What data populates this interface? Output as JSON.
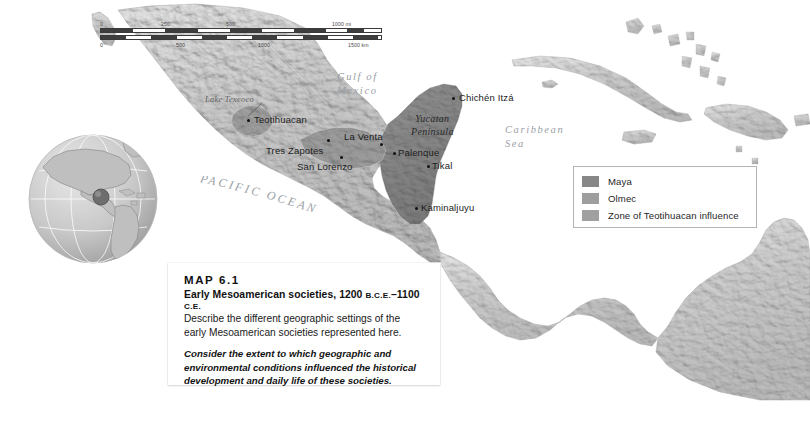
{
  "map": {
    "number": "MAP 6.1",
    "title_main": "Early Mesoamerican societies, 1200 ",
    "title_bce": "B.C.E.",
    "title_dash": "–1100 ",
    "title_ce": "C.E.",
    "prompt": "Describe the different geographic settings of the early Mesoamerican societies represented here.",
    "question": "Consider the extent to which geographic and environmental conditions influenced the historical development and daily life of these societies."
  },
  "scale": {
    "miles": {
      "unit": "1000 mi",
      "ticks": [
        "0",
        "250",
        "500"
      ]
    },
    "kilometers": {
      "unit": "1500 km",
      "ticks": [
        "0",
        "500",
        "1000"
      ]
    }
  },
  "legend": {
    "items": [
      {
        "label": "Maya",
        "color": "#878787"
      },
      {
        "label": "Olmec",
        "color": "#9e9e9e"
      },
      {
        "label": "Zone of Teotihuacan influence",
        "color": "#a0a0a0"
      }
    ]
  },
  "cities": [
    {
      "name": "Teotihuacan",
      "x": 254,
      "y": 115,
      "dot_x": 247,
      "dot_y": 119
    },
    {
      "name": "Tres Zapotes",
      "x": 266,
      "y": 145,
      "dot_x": 327,
      "dot_y": 139
    },
    {
      "name": "San Lorenzo",
      "x": 297,
      "y": 161,
      "dot_x": 340,
      "dot_y": 156
    },
    {
      "name": "La Venta",
      "x": 344,
      "y": 133,
      "dot_x": 380,
      "dot_y": 143
    },
    {
      "name": "Palenque",
      "x": 398,
      "y": 148,
      "dot_x": 393,
      "dot_y": 152
    },
    {
      "name": "Tikal",
      "x": 432,
      "y": 162,
      "dot_x": 427,
      "dot_y": 165
    },
    {
      "name": "Chichén Itzá",
      "x": 459,
      "y": 93,
      "dot_x": 452,
      "dot_y": 97
    },
    {
      "name": "Kaminaljuyu",
      "x": 421,
      "y": 203,
      "dot_x": 415,
      "dot_y": 207
    }
  ],
  "water_labels": [
    {
      "name": "Gulf of\nMexico",
      "x": 337,
      "y": 70
    },
    {
      "name": "Caribbean\nSea",
      "x": 505,
      "y": 123
    }
  ],
  "region_labels": [
    {
      "name": "Yucatan\nPeninsula",
      "x": 411,
      "y": 113
    }
  ],
  "lake_labels": [
    {
      "name": "Lake Texcoco",
      "x": 205,
      "y": 95
    }
  ],
  "ocean_label": "PACIFIC OCEAN",
  "colors": {
    "maya": "#878787",
    "olmec": "#9e9e9e",
    "teotihuacan": "#a0a0a0",
    "land": "#cfcfcf",
    "water": "#ffffff",
    "page_background": "#ffffff"
  }
}
